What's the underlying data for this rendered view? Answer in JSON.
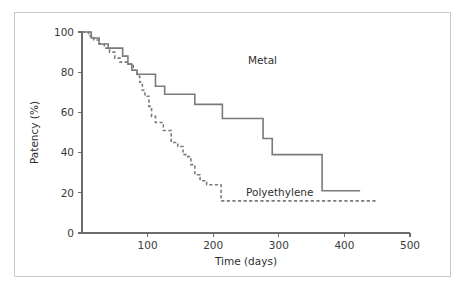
{
  "figure": {
    "background": "#ffffff",
    "frame_color": "#c9c9c9",
    "axis_color": "#6b6b6b",
    "line_color": "#7a7a7a"
  },
  "chart_data": {
    "type": "line",
    "subtype": "kaplan-meier-step",
    "title": "",
    "xlabel": "Time (days)",
    "ylabel": "Patency (%)",
    "xlim": [
      0,
      500
    ],
    "ylim": [
      0,
      100
    ],
    "xticks": [
      0,
      100,
      200,
      300,
      400,
      500
    ],
    "xticklabels": [
      "",
      "100",
      "200",
      "300",
      "400",
      "500"
    ],
    "yticks": [
      0,
      20,
      40,
      60,
      80,
      100
    ],
    "yticklabels": [
      "0",
      "20",
      "40",
      "60",
      "80",
      "100"
    ],
    "grid": false,
    "legend": "inline-annotations",
    "series": [
      {
        "name": "Metal",
        "style": "solid",
        "color": "#7a7a7a",
        "label_x": 248,
        "label_y": 64,
        "points": [
          [
            0,
            100
          ],
          [
            14,
            100
          ],
          [
            14,
            97
          ],
          [
            26,
            97
          ],
          [
            26,
            94
          ],
          [
            40,
            94
          ],
          [
            40,
            92
          ],
          [
            62,
            92
          ],
          [
            62,
            88
          ],
          [
            70,
            88
          ],
          [
            70,
            84
          ],
          [
            76,
            84
          ],
          [
            76,
            81
          ],
          [
            84,
            81
          ],
          [
            84,
            79
          ],
          [
            112,
            79
          ],
          [
            112,
            73
          ],
          [
            126,
            73
          ],
          [
            126,
            69
          ],
          [
            172,
            69
          ],
          [
            172,
            64
          ],
          [
            214,
            64
          ],
          [
            214,
            57
          ],
          [
            276,
            57
          ],
          [
            276,
            47
          ],
          [
            290,
            47
          ],
          [
            290,
            39
          ],
          [
            366,
            39
          ],
          [
            366,
            21
          ],
          [
            424,
            21
          ]
        ]
      },
      {
        "name": "Polyethylene",
        "style": "dashed",
        "color": "#7a7a7a",
        "label_x": 246,
        "label_y": 196,
        "points": [
          [
            0,
            100
          ],
          [
            10,
            100
          ],
          [
            10,
            98
          ],
          [
            18,
            98
          ],
          [
            18,
            96
          ],
          [
            26,
            96
          ],
          [
            26,
            94
          ],
          [
            34,
            94
          ],
          [
            34,
            92
          ],
          [
            42,
            92
          ],
          [
            42,
            90
          ],
          [
            50,
            90
          ],
          [
            50,
            87
          ],
          [
            58,
            87
          ],
          [
            58,
            85
          ],
          [
            72,
            85
          ],
          [
            72,
            84
          ],
          [
            78,
            84
          ],
          [
            78,
            81
          ],
          [
            84,
            81
          ],
          [
            84,
            78
          ],
          [
            88,
            78
          ],
          [
            88,
            75
          ],
          [
            92,
            75
          ],
          [
            92,
            71
          ],
          [
            96,
            71
          ],
          [
            96,
            68
          ],
          [
            102,
            68
          ],
          [
            102,
            63
          ],
          [
            106,
            63
          ],
          [
            106,
            58
          ],
          [
            112,
            58
          ],
          [
            112,
            55
          ],
          [
            124,
            55
          ],
          [
            124,
            51
          ],
          [
            136,
            51
          ],
          [
            136,
            45
          ],
          [
            146,
            45
          ],
          [
            146,
            43
          ],
          [
            154,
            43
          ],
          [
            154,
            39
          ],
          [
            160,
            39
          ],
          [
            160,
            38
          ],
          [
            166,
            38
          ],
          [
            166,
            34
          ],
          [
            172,
            34
          ],
          [
            172,
            29
          ],
          [
            180,
            29
          ],
          [
            180,
            26
          ],
          [
            190,
            26
          ],
          [
            190,
            24
          ],
          [
            212,
            24
          ],
          [
            212,
            16
          ],
          [
            451,
            16
          ]
        ]
      }
    ]
  }
}
